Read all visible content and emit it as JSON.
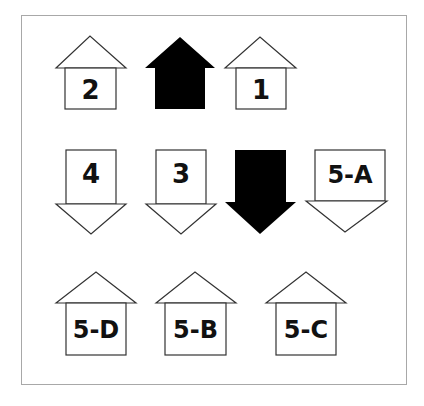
{
  "diagram": {
    "frame_color": "#a8a8a8",
    "stroke_color": "#333333",
    "fill_color": "#000000",
    "rows": [
      {
        "items": [
          {
            "id": "arrow-2",
            "direction": "up",
            "style": "outline",
            "label": "2"
          },
          {
            "id": "arrow-black-up",
            "direction": "up",
            "style": "filled",
            "label": ""
          },
          {
            "id": "arrow-1",
            "direction": "up",
            "style": "outline",
            "label": "1"
          }
        ]
      },
      {
        "items": [
          {
            "id": "arrow-4",
            "direction": "down",
            "style": "outline",
            "label": "4"
          },
          {
            "id": "arrow-3",
            "direction": "down",
            "style": "outline",
            "label": "3"
          },
          {
            "id": "arrow-black-down",
            "direction": "down",
            "style": "filled",
            "label": ""
          },
          {
            "id": "arrow-5a",
            "direction": "down",
            "style": "outline",
            "label": "5-A"
          }
        ]
      },
      {
        "items": [
          {
            "id": "arrow-5d",
            "direction": "up",
            "style": "outline",
            "label": "5-D"
          },
          {
            "id": "arrow-5b",
            "direction": "up",
            "style": "outline",
            "label": "5-B"
          },
          {
            "id": "arrow-5c",
            "direction": "up",
            "style": "outline",
            "label": "5-C"
          }
        ]
      }
    ]
  }
}
